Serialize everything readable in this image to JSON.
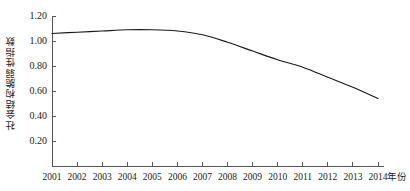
{
  "chart_data": {
    "type": "line",
    "title": "",
    "xlabel": "年份",
    "ylabel": "社会结构脆弱性指数",
    "x": [
      2001,
      2002,
      2003,
      2004,
      2005,
      2006,
      2007,
      2008,
      2009,
      2010,
      2011,
      2012,
      2013,
      2014
    ],
    "categories": [
      "2001",
      "2002",
      "2003",
      "2004",
      "2005",
      "2006",
      "2007",
      "2008",
      "2009",
      "2010",
      "2011",
      "2012",
      "2013",
      "2014"
    ],
    "values": [
      1.06,
      1.07,
      1.08,
      1.09,
      1.09,
      1.08,
      1.05,
      0.99,
      0.92,
      0.85,
      0.79,
      0.71,
      0.63,
      0.54
    ],
    "series": [
      {
        "name": "社会结构脆弱性指数",
        "values": [
          1.06,
          1.07,
          1.08,
          1.09,
          1.09,
          1.08,
          1.05,
          0.99,
          0.92,
          0.85,
          0.79,
          0.71,
          0.63,
          0.54
        ]
      }
    ],
    "xlim": [
      2001,
      2014
    ],
    "ylim": [
      0.0,
      1.2
    ],
    "ytick_values": [
      0.0,
      0.2,
      0.4,
      0.6,
      0.8,
      1.0,
      1.2
    ],
    "ytick_labels": [
      "",
      "0.20",
      "0.40",
      "0.60",
      "0.80",
      "1.00",
      "1.20"
    ],
    "grid": false,
    "legend": false,
    "legend_position": "none",
    "line_color": "#1a1a1a",
    "line_width": 1.2,
    "markers": false
  }
}
